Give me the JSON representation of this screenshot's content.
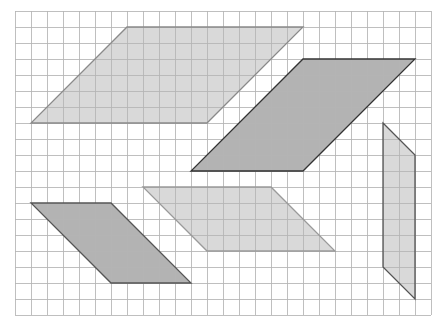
{
  "grid": {
    "origin_x": 15,
    "origin_y": 11,
    "cell_size": 16,
    "columns": 26,
    "rows": 19,
    "line_color": "#b4b4b4",
    "background": "#ffffff"
  },
  "shapes": [
    {
      "name": "parallelogram-light-top-left",
      "points": [
        [
          7,
          1
        ],
        [
          18,
          1
        ],
        [
          12,
          7
        ],
        [
          1,
          7
        ]
      ],
      "fill": "#d9d9d9",
      "stroke": "#8a8a8a"
    },
    {
      "name": "parallelogram-dark-top-right",
      "points": [
        [
          18,
          3
        ],
        [
          25,
          3
        ],
        [
          18,
          10
        ],
        [
          11,
          10
        ]
      ],
      "fill": "#b3b3b3",
      "stroke": "#333333"
    },
    {
      "name": "parallelogram-light-thin-right",
      "points": [
        [
          23,
          7
        ],
        [
          25,
          9
        ],
        [
          25,
          18
        ],
        [
          23,
          16
        ]
      ],
      "fill": "#d9d9d9",
      "stroke": "#555555"
    },
    {
      "name": "parallelogram-dark-bottom-left",
      "points": [
        [
          1,
          12
        ],
        [
          6,
          12
        ],
        [
          11,
          17
        ],
        [
          6,
          17
        ]
      ],
      "fill": "#b3b3b3",
      "stroke": "#555555"
    },
    {
      "name": "parallelogram-light-middle",
      "points": [
        [
          8,
          11
        ],
        [
          16,
          11
        ],
        [
          20,
          15
        ],
        [
          12,
          15
        ]
      ],
      "fill": "#d9d9d9",
      "stroke": "#9a9a9a"
    }
  ]
}
